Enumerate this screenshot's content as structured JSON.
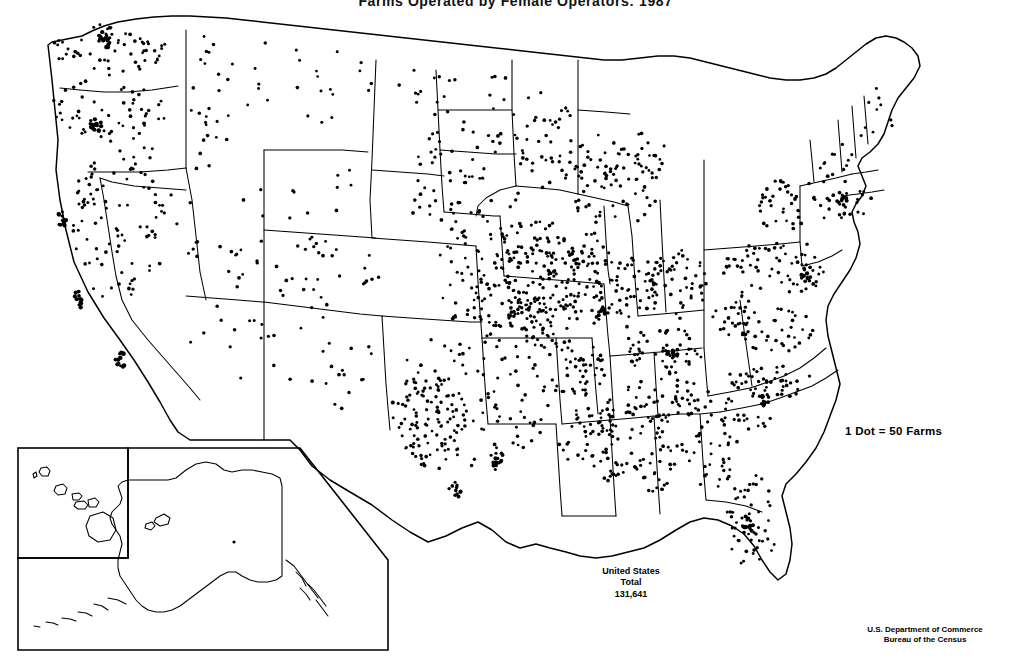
{
  "page": {
    "width": 1031,
    "height": 668,
    "background_color": "#ffffff",
    "ink_color": "#000000",
    "document_kind": "scanned-census-thematic-map"
  },
  "title": {
    "text": "Farms Operated by Female Operators: 1987",
    "truncated_at_top_edge": true
  },
  "legend": {
    "text": "1 Dot = 50 Farms",
    "dot_value": 50,
    "unit": "Farms"
  },
  "us_total": {
    "line1": "United States",
    "line2": "Total",
    "line3": "131,641",
    "value": 131641
  },
  "source": {
    "line1": "U.S. Department of Commerce",
    "line2": "Bureau of the Census"
  },
  "insets": [
    {
      "name": "hawaii-inset",
      "label": "Hawaii"
    },
    {
      "name": "alaska-inset",
      "label": "Alaska"
    }
  ],
  "chart_data": {
    "type": "map",
    "map_type": "dot-density",
    "title": "Farms Operated by Female Operators: 1987",
    "projection": "albers-equal-area-conic",
    "region": "United States including Alaska and Hawaii insets",
    "dot_value": 50,
    "dot_unit": "farms",
    "national_total": 131641,
    "legend_text": "1 Dot = 50 Farms",
    "source": "U.S. Department of Commerce, Bureau of the Census",
    "density_classes": [
      {
        "label": "very-high",
        "description": "Texas, Corn Belt, Puget Sound, coastal California"
      },
      {
        "label": "high",
        "description": "Missouri, Kentucky, Tennessee, Oklahoma, Appalachia, Florida peninsula"
      },
      {
        "label": "moderate",
        "description": "Great Plains, Southeast, Mid-Atlantic, New York, New England"
      },
      {
        "label": "low",
        "description": "Northern Plains, Rocky Mountains"
      },
      {
        "label": "very-low",
        "description": "Nevada, Utah, Wyoming, interior Alaska"
      }
    ],
    "state_dot_counts": [
      {
        "state": "Washington",
        "dots": 58
      },
      {
        "state": "Oregon",
        "dots": 50
      },
      {
        "state": "California",
        "dots": 96
      },
      {
        "state": "Idaho",
        "dots": 24
      },
      {
        "state": "Nevada",
        "dots": 8
      },
      {
        "state": "Montana",
        "dots": 24
      },
      {
        "state": "Wyoming",
        "dots": 10
      },
      {
        "state": "Utah",
        "dots": 16
      },
      {
        "state": "Colorado",
        "dots": 30
      },
      {
        "state": "Arizona",
        "dots": 14
      },
      {
        "state": "New Mexico",
        "dots": 20
      },
      {
        "state": "North Dakota",
        "dots": 20
      },
      {
        "state": "South Dakota",
        "dots": 24
      },
      {
        "state": "Nebraska",
        "dots": 36
      },
      {
        "state": "Kansas",
        "dots": 50
      },
      {
        "state": "Oklahoma",
        "dots": 66
      },
      {
        "state": "Texas",
        "dots": 190
      },
      {
        "state": "Minnesota",
        "dots": 46
      },
      {
        "state": "Iowa",
        "dots": 62
      },
      {
        "state": "Missouri",
        "dots": 90
      },
      {
        "state": "Arkansas",
        "dots": 48
      },
      {
        "state": "Louisiana",
        "dots": 36
      },
      {
        "state": "Wisconsin",
        "dots": 44
      },
      {
        "state": "Illinois",
        "dots": 66
      },
      {
        "state": "Michigan",
        "dots": 44
      },
      {
        "state": "Indiana",
        "dots": 44
      },
      {
        "state": "Ohio",
        "dots": 52
      },
      {
        "state": "Kentucky",
        "dots": 56
      },
      {
        "state": "Tennessee",
        "dots": 56
      },
      {
        "state": "Mississippi",
        "dots": 38
      },
      {
        "state": "Alabama",
        "dots": 40
      },
      {
        "state": "Georgia",
        "dots": 40
      },
      {
        "state": "Florida",
        "dots": 52
      },
      {
        "state": "South Carolina",
        "dots": 22
      },
      {
        "state": "North Carolina",
        "dots": 44
      },
      {
        "state": "Virginia",
        "dots": 40
      },
      {
        "state": "West Virginia",
        "dots": 24
      },
      {
        "state": "Pennsylvania",
        "dots": 42
      },
      {
        "state": "New York",
        "dots": 44
      },
      {
        "state": "Vermont",
        "dots": 8
      },
      {
        "state": "New Hampshire",
        "dots": 6
      },
      {
        "state": "Maine",
        "dots": 10
      },
      {
        "state": "Massachusetts",
        "dots": 10
      },
      {
        "state": "Connecticut",
        "dots": 6
      },
      {
        "state": "Rhode Island",
        "dots": 2
      },
      {
        "state": "New Jersey",
        "dots": 8
      },
      {
        "state": "Delaware",
        "dots": 3
      },
      {
        "state": "Maryland",
        "dots": 10
      },
      {
        "state": "Alaska",
        "dots": 1
      },
      {
        "state": "Hawaii",
        "dots": 0
      }
    ]
  }
}
